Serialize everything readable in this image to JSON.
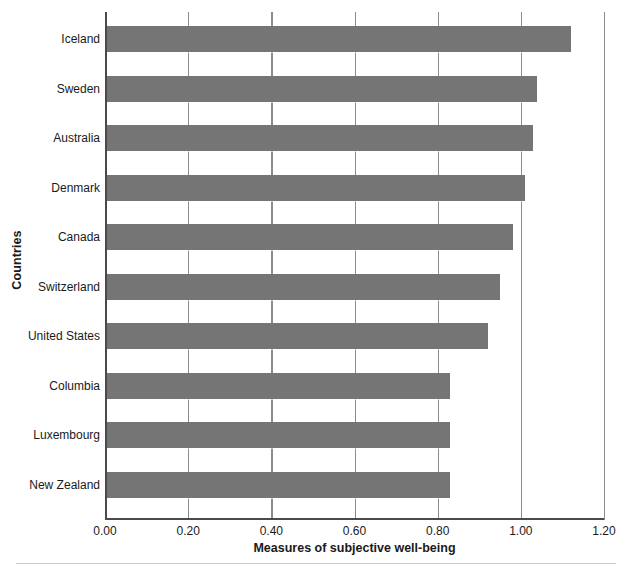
{
  "chart_data": {
    "type": "bar",
    "orientation": "horizontal",
    "title": "",
    "xlabel": "Measures of subjective well-being",
    "ylabel": "Countries",
    "categories": [
      "Iceland",
      "Sweden",
      "Australia",
      "Denmark",
      "Canada",
      "Switzerland",
      "United States",
      "Columbia",
      "Luxembourg",
      "New Zealand"
    ],
    "values": [
      1.12,
      1.04,
      1.03,
      1.01,
      0.98,
      0.95,
      0.92,
      0.83,
      0.83,
      0.83
    ],
    "xlim": [
      0.0,
      1.2
    ],
    "xticks": [
      0.0,
      0.2,
      0.4,
      0.6,
      0.8,
      1.0,
      1.2
    ],
    "xticklabels": [
      "0.00",
      "0.20",
      "0.40",
      "0.60",
      "0.80",
      "1.00",
      "1.20"
    ],
    "grid": "vertical",
    "legend": "none",
    "bar_color": "#757575",
    "gridline_color": "#8c8c8c",
    "axis_color": "#4a4a4a"
  }
}
